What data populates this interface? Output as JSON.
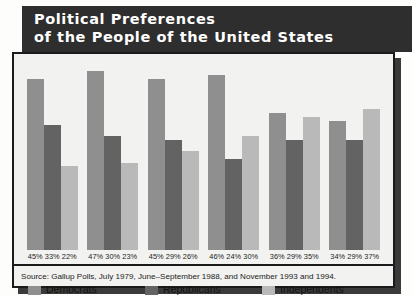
{
  "title": {
    "line1": "Political Preferences",
    "line2": "of the People of the United States"
  },
  "legend": {
    "items": [
      {
        "label": "Democrats",
        "color": "#8f8f8f",
        "key": "dem"
      },
      {
        "label": "Republicans",
        "color": "#636363",
        "key": "rep"
      },
      {
        "label": "Independents",
        "color": "#b9b9b9",
        "key": "ind"
      }
    ]
  },
  "source": {
    "text": "Source: Gallup Polls, July 1979, June–September 1988, and November 1993 and 1994."
  },
  "chart_data": {
    "type": "bar",
    "title": "Political Preferences of the People of the United States",
    "xlabel": "",
    "ylabel": "",
    "ylim": [
      0,
      50
    ],
    "grid": false,
    "legend_position": "bottom",
    "categories": [
      "1950",
      "1960",
      "1970",
      "1980",
      "1990",
      "1994"
    ],
    "series": [
      {
        "name": "Democrats",
        "color": "#8f8f8f",
        "values": [
          45,
          47,
          45,
          46,
          36,
          34
        ],
        "labels": [
          "45%",
          "47%",
          "45%",
          "46%",
          "36%",
          "34%"
        ]
      },
      {
        "name": "Republicans",
        "color": "#636363",
        "values": [
          33,
          30,
          29,
          24,
          29,
          29
        ],
        "labels": [
          "33%",
          "30%",
          "29%",
          "24%",
          "29%",
          "29%"
        ]
      },
      {
        "name": "Independents",
        "color": "#b9b9b9",
        "values": [
          22,
          23,
          26,
          30,
          35,
          37
        ],
        "labels": [
          "22%",
          "23%",
          "26%",
          "30%",
          "35%",
          "37%"
        ]
      }
    ],
    "groups": [
      {
        "year": "1950",
        "dem": 45,
        "rep": 33,
        "ind": 22,
        "dem_label": "45%",
        "rep_label": "33%",
        "ind_label": "22%"
      },
      {
        "year": "1960",
        "dem": 47,
        "rep": 30,
        "ind": 23,
        "dem_label": "47%",
        "rep_label": "30%",
        "ind_label": "23%"
      },
      {
        "year": "1970",
        "dem": 45,
        "rep": 29,
        "ind": 26,
        "dem_label": "45%",
        "rep_label": "29%",
        "ind_label": "26%"
      },
      {
        "year": "1980",
        "dem": 46,
        "rep": 24,
        "ind": 30,
        "dem_label": "46%",
        "rep_label": "24%",
        "ind_label": "30%"
      },
      {
        "year": "1990",
        "dem": 36,
        "rep": 29,
        "ind": 35,
        "dem_label": "36%",
        "rep_label": "29%",
        "ind_label": "35%"
      },
      {
        "year": "1994",
        "dem": 34,
        "rep": 29,
        "ind": 37,
        "dem_label": "34%",
        "rep_label": "29%",
        "ind_label": "37%"
      }
    ]
  }
}
